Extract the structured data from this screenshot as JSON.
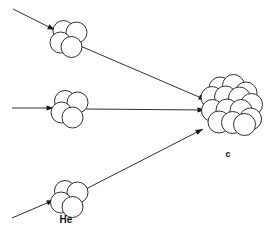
{
  "diagram": {
    "background_color": "#ffffff",
    "stroke_color": "#1a1a1a",
    "labels": {
      "helium": "He",
      "carbon": "c"
    },
    "particles": [
      {
        "id": "helium-top",
        "name": "helium-nucleus-top",
        "label": "",
        "center": [
          70,
          38
        ],
        "nucleon_radius": 10.5,
        "nucleons": [
          [
            63.5,
            31.0
          ],
          [
            76.5,
            32.5
          ],
          [
            60.5,
            42.5
          ],
          [
            71.5,
            47.0
          ]
        ]
      },
      {
        "id": "helium-middle",
        "name": "helium-nucleus-middle",
        "label": "",
        "center": [
          70,
          108
        ],
        "nucleon_radius": 10.5,
        "nucleons": [
          [
            65.0,
            101.0
          ],
          [
            77.5,
            102.5
          ],
          [
            61.5,
            112.5
          ],
          [
            72.5,
            117.5
          ]
        ]
      },
      {
        "id": "helium-bottom",
        "name": "helium-nucleus-bottom",
        "label": "He",
        "center": [
          70,
          198
        ],
        "nucleon_radius": 10.5,
        "nucleons": [
          [
            65.0,
            191.0
          ],
          [
            77.5,
            192.5
          ],
          [
            61.0,
            202.5
          ],
          [
            72.5,
            207.0
          ]
        ]
      }
    ],
    "product": {
      "id": "carbon-nucleus",
      "name": "carbon-nucleus",
      "label": "c",
      "label_position": [
        228,
        157
      ],
      "center": [
        229,
        110
      ],
      "nucleon_radius": 11.0,
      "nucleons": [
        [
          220.0,
          88.0
        ],
        [
          233.5,
          85.5
        ],
        [
          246.0,
          93.0
        ],
        [
          212.0,
          97.5
        ],
        [
          225.5,
          97.0
        ],
        [
          239.5,
          98.0
        ],
        [
          251.5,
          104.5
        ],
        [
          212.5,
          110.5
        ],
        [
          227.0,
          110.0
        ],
        [
          241.0,
          110.5
        ],
        [
          250.5,
          119.0
        ],
        [
          219.0,
          122.0
        ],
        [
          232.5,
          122.5
        ],
        [
          244.5,
          124.5
        ]
      ]
    },
    "rays": [
      {
        "id": "incoming-top",
        "name": "incoming-ray-top",
        "x1": 13,
        "y1": 9,
        "x2": 55,
        "y2": 30,
        "arrowhead": true,
        "arrow_angle_deg": 26.5
      },
      {
        "id": "incoming-middle",
        "name": "incoming-ray-middle",
        "x1": 12,
        "y1": 108,
        "x2": 54,
        "y2": 108,
        "arrowhead": true,
        "arrow_angle_deg": 0
      },
      {
        "id": "incoming-bottom",
        "name": "incoming-ray-bottom",
        "x1": 12,
        "y1": 218,
        "x2": 54,
        "y2": 200,
        "arrowhead": true,
        "arrow_angle_deg": -23.2
      },
      {
        "id": "fusion-top",
        "name": "fusion-ray-top",
        "x1": 78,
        "y1": 45,
        "x2": 206,
        "y2": 100,
        "arrowhead": true,
        "arrow_angle_deg": 23.2
      },
      {
        "id": "fusion-middle",
        "name": "fusion-ray-middle",
        "x1": 86,
        "y1": 109,
        "x2": 205,
        "y2": 110,
        "arrowhead": true,
        "arrow_angle_deg": 0.5
      },
      {
        "id": "fusion-bottom",
        "name": "fusion-ray-bottom",
        "x1": 84,
        "y1": 190,
        "x2": 203,
        "y2": 129,
        "arrowhead": true,
        "arrow_angle_deg": -27.1
      }
    ]
  }
}
